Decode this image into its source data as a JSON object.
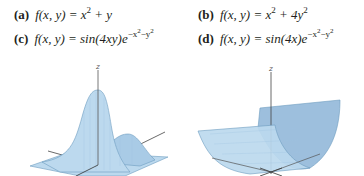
{
  "functions": [
    {
      "label": "(a)",
      "lhs": "f(x, y) = ",
      "rhs_parts": [
        "x",
        "2",
        " + y"
      ]
    },
    {
      "label": "(b)",
      "lhs": "f(x, y) = ",
      "rhs_parts": [
        "x",
        "2",
        " + 4y",
        "2"
      ]
    },
    {
      "label": "(c)",
      "lhs": "f(x, y) = ",
      "rhs_parts": [
        "sin(4xy)e",
        "−x",
        "2",
        "−y",
        "2"
      ]
    },
    {
      "label": "(d)",
      "lhs": "f(x, y) = ",
      "rhs_parts": [
        "sin(4x)e",
        "−x",
        "2",
        "−y",
        "2"
      ]
    }
  ],
  "plots": [
    {
      "axis_label": "z",
      "surface_color": "#bcd9ee",
      "edge_color": "#6d9cc0",
      "description": "bell-shaped surface with peak and smaller side hump"
    },
    {
      "axis_label": "z",
      "surface_color": "#bcd9ee",
      "edge_color": "#6d9cc0",
      "description": "parabolic cylinder trough surface"
    }
  ]
}
